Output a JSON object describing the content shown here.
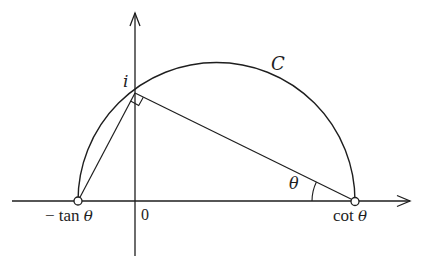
{
  "diagram": {
    "type": "geometry",
    "labels": {
      "i": "i",
      "curve": "C",
      "angle": "θ",
      "origin": "0",
      "left_point_prefix": "− tan ",
      "left_point_theta": "θ",
      "right_point_prefix": "cot ",
      "right_point_theta": "θ"
    },
    "points": {
      "neg_tan_theta": {
        "x": 78,
        "y": 201
      },
      "i": {
        "x": 135,
        "y": 93
      },
      "cot_theta": {
        "x": 355,
        "y": 201
      },
      "origin": {
        "x": 135,
        "y": 201
      }
    },
    "axes": {
      "x_axis": {
        "from": [
          12,
          201
        ],
        "to": [
          412,
          201
        ],
        "arrow": "right"
      },
      "y_axis": {
        "from": [
          135,
          256
        ],
        "to": [
          135,
          12
        ],
        "arrow": "up"
      }
    },
    "semicircle": {
      "center": [
        216.5,
        201
      ],
      "radius": 138.5
    },
    "colors": {
      "ink": "#1e1e1e",
      "background": "#ffffff"
    }
  }
}
